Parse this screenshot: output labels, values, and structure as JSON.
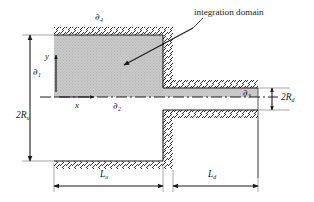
{
  "figure": {
    "type": "engineering-schematic",
    "width": 314,
    "height": 202,
    "background": "#ffffff",
    "line_color": "#1a1a1a",
    "shade_color": "#c9c9c9",
    "hatch_color": "#1a1a1a"
  },
  "annotations": {
    "integration_domain": "integration domain"
  },
  "boundaries": {
    "d1": {
      "partial": "∂",
      "sub": "1"
    },
    "d2": {
      "partial": "∂",
      "sub": "2"
    },
    "d3": {
      "partial": "∂",
      "sub": "3"
    },
    "d4": {
      "partial": "∂",
      "sub": "4"
    }
  },
  "axes": {
    "x": "x",
    "y": "y"
  },
  "dimensions": {
    "radius_upstream": {
      "text": "2R",
      "sub": "u"
    },
    "radius_downstream": {
      "text": "2R",
      "sub": "d"
    },
    "length_upstream": {
      "text": "L",
      "sub": "u"
    },
    "length_downstream": {
      "text": "L",
      "sub": "d"
    }
  },
  "geometry": {
    "origin_px": {
      "x": 54,
      "y": 97
    },
    "upstream_wall_top_y": 32,
    "upstream_wall_bot_y": 161,
    "downstream_wall_top_y": 88,
    "downstream_wall_bot_y": 110,
    "inlet_x": 54,
    "step_x": 163,
    "outlet_x": 258
  }
}
